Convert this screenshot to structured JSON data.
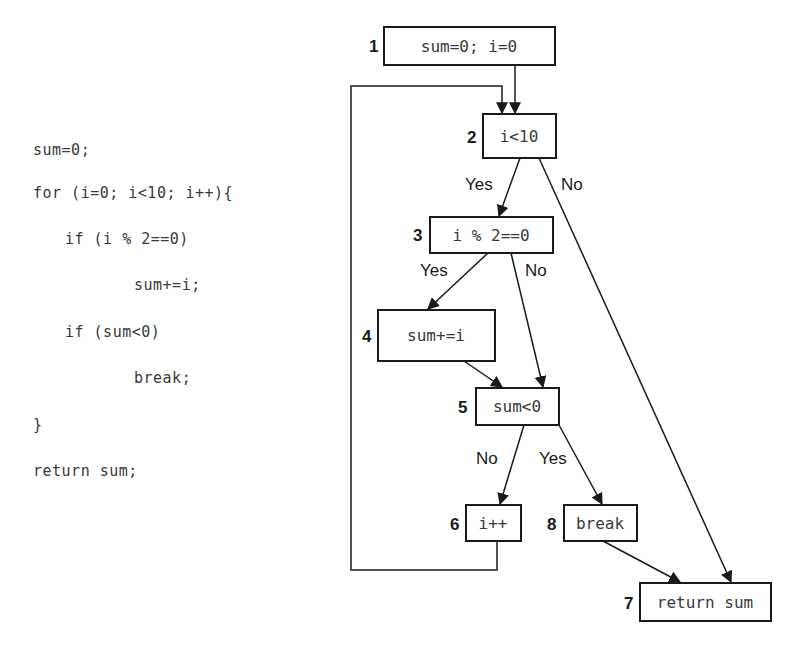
{
  "code": {
    "lines": [
      {
        "text": "sum=0;",
        "indent": 0
      },
      {
        "text": "for (i=0; i<10; i++){",
        "indent": 0
      },
      {
        "text": "if (i % 2==0)",
        "indent": 1
      },
      {
        "text": "sum+=i;",
        "indent": 2
      },
      {
        "text": "if (sum<0)",
        "indent": 1
      },
      {
        "text": "break;",
        "indent": 2
      },
      {
        "text": "}",
        "indent": 0
      },
      {
        "text": "return sum;",
        "indent": 0
      }
    ]
  },
  "flowchart": {
    "nodes": [
      {
        "id": "1",
        "label": "sum=0; i=0"
      },
      {
        "id": "2",
        "label": "i<10"
      },
      {
        "id": "3",
        "label": "i % 2==0"
      },
      {
        "id": "4",
        "label": "sum+=i"
      },
      {
        "id": "5",
        "label": "sum<0"
      },
      {
        "id": "6",
        "label": "i++"
      },
      {
        "id": "8",
        "label": "break"
      },
      {
        "id": "7",
        "label": "return sum"
      }
    ],
    "edges": [
      {
        "from": "1",
        "to": "2",
        "label": ""
      },
      {
        "from": "2",
        "to": "3",
        "label": "Yes"
      },
      {
        "from": "2",
        "to": "7",
        "label": "No"
      },
      {
        "from": "3",
        "to": "4",
        "label": "Yes"
      },
      {
        "from": "3",
        "to": "5",
        "label": "No"
      },
      {
        "from": "4",
        "to": "5",
        "label": ""
      },
      {
        "from": "5",
        "to": "6",
        "label": "No"
      },
      {
        "from": "5",
        "to": "8",
        "label": "Yes"
      },
      {
        "from": "6",
        "to": "2",
        "label": ""
      },
      {
        "from": "8",
        "to": "7",
        "label": ""
      }
    ]
  }
}
